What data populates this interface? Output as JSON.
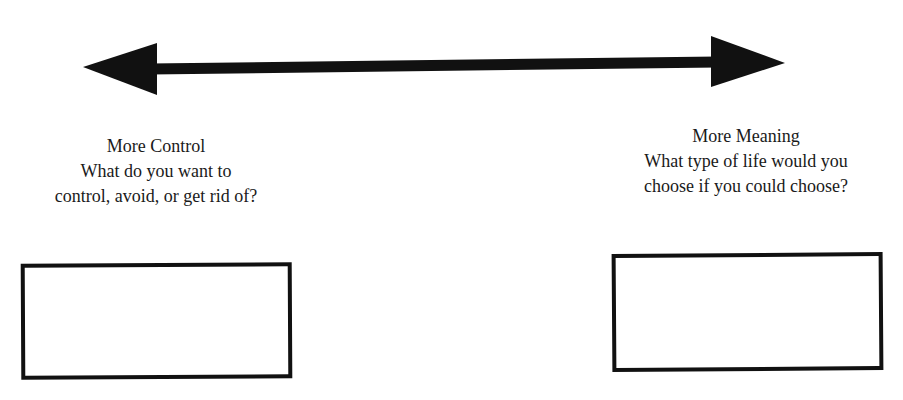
{
  "diagram": {
    "arrow": {
      "type": "double-headed",
      "color": "#111111",
      "left_end": "More Control",
      "right_end": "More Meaning"
    },
    "left_pole": {
      "title": "More Control",
      "line1": "What do you want to",
      "line2": "control, avoid, or get rid of?"
    },
    "right_pole": {
      "title": "More Meaning",
      "line1": "What type of life would you",
      "line2": "choose if you could choose?"
    },
    "left_box": {
      "value": ""
    },
    "right_box": {
      "value": ""
    }
  }
}
